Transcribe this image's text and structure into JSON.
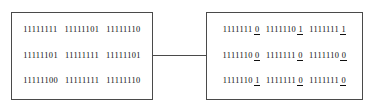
{
  "figure": {
    "left_panel": {
      "name": "original-bit-block",
      "rows": [
        {
          "groups": [
            {
              "prefix": "11111111",
              "lsb": ""
            },
            {
              "prefix": "11111101",
              "lsb": ""
            },
            {
              "prefix": "11111110",
              "lsb": ""
            }
          ]
        },
        {
          "groups": [
            {
              "prefix": "11111101",
              "lsb": ""
            },
            {
              "prefix": "11111111",
              "lsb": ""
            },
            {
              "prefix": "11111101",
              "lsb": ""
            }
          ]
        },
        {
          "groups": [
            {
              "prefix": "11111100",
              "lsb": ""
            },
            {
              "prefix": "11111111",
              "lsb": ""
            },
            {
              "prefix": "11111110",
              "lsb": ""
            }
          ]
        }
      ]
    },
    "right_panel": {
      "name": "modified-bit-block",
      "rows": [
        {
          "groups": [
            {
              "prefix": "1111111",
              "lsb": "0"
            },
            {
              "prefix": "1111110",
              "lsb": "1"
            },
            {
              "prefix": "1111111",
              "lsb": "1"
            }
          ]
        },
        {
          "groups": [
            {
              "prefix": "1111110",
              "lsb": "0"
            },
            {
              "prefix": "1111111",
              "lsb": "0"
            },
            {
              "prefix": "1111110",
              "lsb": "0"
            }
          ]
        },
        {
          "groups": [
            {
              "prefix": "1111110",
              "lsb": "1"
            },
            {
              "prefix": "1111111",
              "lsb": "0"
            },
            {
              "prefix": "1111111",
              "lsb": "0"
            }
          ]
        }
      ]
    },
    "connector": {
      "name": "panel-connector-line"
    },
    "colors": {
      "border": "#4a4a4a",
      "text": "#101010",
      "background": "#ffffff"
    }
  }
}
